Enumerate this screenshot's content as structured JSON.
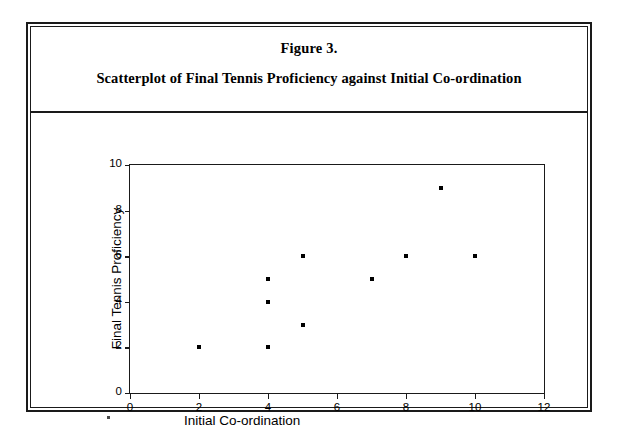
{
  "figure": {
    "number": "Figure 3.",
    "caption": "Scatterplot of Final Tennis Proficiency against Initial Co-ordination"
  },
  "axis_titles": {
    "x": "Initial Co-ordination",
    "y": "Final Tennis Proficiency"
  },
  "colors": {
    "border": "#1a1a1a",
    "point": "#000000",
    "background": "#ffffff"
  },
  "chart_data": {
    "type": "scatter",
    "title": "Scatterplot of Final Tennis Proficiency against Initial Co-ordination",
    "xlabel": "Initial Co-ordination",
    "ylabel": "Final Tennis Proficiency",
    "xlim": [
      0,
      12
    ],
    "ylim": [
      0,
      10
    ],
    "xticks": [
      0,
      2,
      4,
      6,
      8,
      10,
      12
    ],
    "yticks": [
      0,
      2,
      4,
      6,
      8,
      10
    ],
    "grid": false,
    "legend": null,
    "marker": "square",
    "points": [
      {
        "x": 2,
        "y": 2
      },
      {
        "x": 4,
        "y": 5
      },
      {
        "x": 4,
        "y": 4
      },
      {
        "x": 4,
        "y": 2
      },
      {
        "x": 5,
        "y": 6
      },
      {
        "x": 5,
        "y": 3
      },
      {
        "x": 7,
        "y": 5
      },
      {
        "x": 8,
        "y": 6
      },
      {
        "x": 9,
        "y": 9
      },
      {
        "x": 10,
        "y": 6
      }
    ]
  }
}
